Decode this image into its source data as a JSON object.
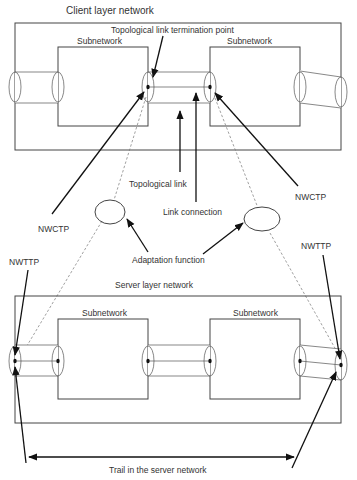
{
  "diagram": {
    "client": {
      "title": "Client layer network",
      "subnet_left": "Subnetwork",
      "subnet_right": "Subnetwork",
      "tltp_label": "Topological link termination point"
    },
    "annotations": {
      "topological_link": "Topological link",
      "link_connection": "Link connection",
      "nwctp_left": "NWCTP",
      "nwctp_right": "NWCTP",
      "adaptation_function": "Adaptation function",
      "nwttp_left": "NWTTP",
      "nwttp_right": "NWTTP"
    },
    "server": {
      "title": "Server layer network",
      "subnet_left": "Subnetwork",
      "subnet_right": "Subnetwork",
      "trail_label": "Trail in the server network"
    }
  }
}
